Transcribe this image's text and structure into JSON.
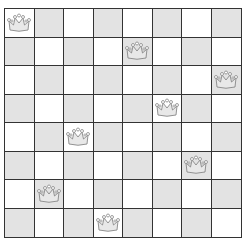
{
  "board": {
    "size": 8,
    "colors": {
      "light": "#ffffff",
      "dark": "#e3e3e3",
      "grid": "#333333",
      "queen_fill": "#e8e8e8",
      "queen_stroke": "#888888"
    },
    "queens": [
      {
        "row": 0,
        "col": 0
      },
      {
        "row": 1,
        "col": 4
      },
      {
        "row": 2,
        "col": 7
      },
      {
        "row": 3,
        "col": 5
      },
      {
        "row": 4,
        "col": 2
      },
      {
        "row": 5,
        "col": 6
      },
      {
        "row": 6,
        "col": 1
      },
      {
        "row": 7,
        "col": 3
      }
    ],
    "piece_icon": "crown-icon"
  }
}
